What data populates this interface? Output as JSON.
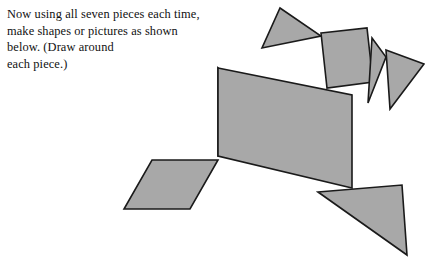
{
  "page": {
    "width": 425,
    "height": 257,
    "background_color": "#ffffff"
  },
  "instruction": {
    "text": "Now using all seven pieces each time,\nmake shapes or pictures as shown\nbelow. (Draw around\neach piece.)",
    "color": "#111111"
  },
  "figure": {
    "name": "tangram-dog-figure",
    "fill_color": "#a8a8a8",
    "stroke_color": "#1a1a1a",
    "pieces": [
      {
        "name": "large-triangle-body",
        "role": "body-upper-left",
        "points": "218,68 218,156 306,156"
      },
      {
        "name": "large-triangle-hindquarters",
        "role": "body-lower-right",
        "points": "218,68 352,95 352,188 218,156"
      },
      {
        "name": "small-triangle-head",
        "role": "head",
        "points": "280,8 321,36 262,48"
      },
      {
        "name": "square-neck",
        "role": "neck",
        "points": "321,33 367,28 373,82 327,88"
      },
      {
        "name": "small-triangle-ear-left",
        "role": "ear-near",
        "points": "372,38 386,57 368,103"
      },
      {
        "name": "medium-triangle-ear-right",
        "role": "ear-far",
        "points": "386,50 424,64 390,109"
      },
      {
        "name": "parallelogram-foreleg",
        "role": "front-leg",
        "points": "152,160 218,160 190,209 124,209"
      },
      {
        "name": "medium-triangle-tail",
        "role": "tail",
        "points": "318,192 402,185 407,255"
      }
    ]
  }
}
